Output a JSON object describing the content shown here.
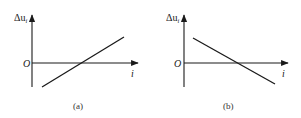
{
  "panels": [
    {
      "id": "a",
      "caption": "(a)",
      "y_axis_label_delta": "Δu",
      "y_axis_label_sub": "i",
      "origin_label": "O",
      "x_axis_label": "i",
      "line_trend": "increasing"
    },
    {
      "id": "b",
      "caption": "(b)",
      "y_axis_label_delta": "Δu",
      "y_axis_label_sub": "i",
      "origin_label": "O",
      "x_axis_label": "i",
      "line_trend": "decreasing"
    }
  ],
  "colors": {
    "stroke": "#1a1a1a",
    "background": "#ffffff"
  }
}
